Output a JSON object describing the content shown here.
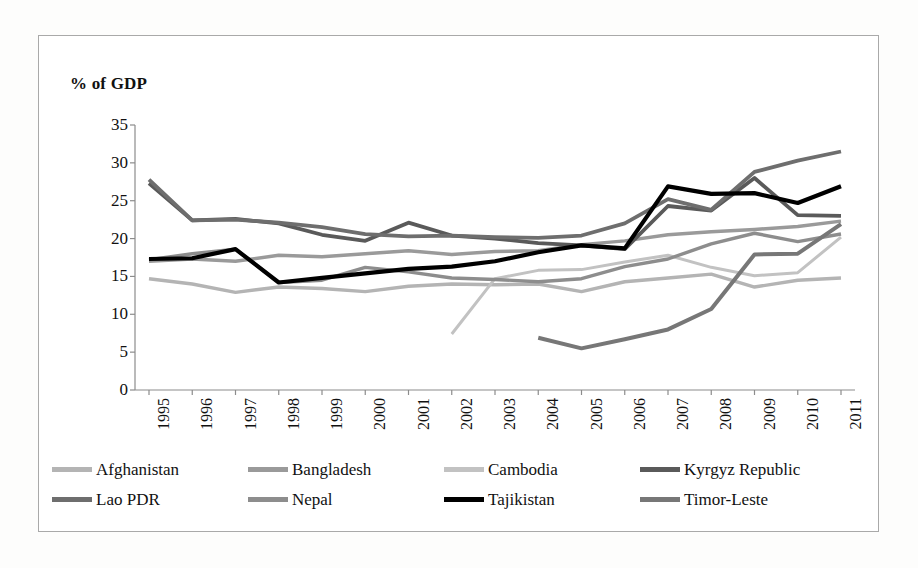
{
  "figure": {
    "axis_title": "% of GDP"
  },
  "chart_data": {
    "type": "line",
    "title": "% of GDP",
    "xlabel": "",
    "ylabel": "% of GDP",
    "ylim": [
      0,
      35
    ],
    "ytick_step": 5,
    "yticks": [
      "35",
      "30",
      "25",
      "20",
      "15",
      "10",
      "5",
      "0"
    ],
    "grid": false,
    "legend_position": "bottom",
    "x": [
      1995,
      1996,
      1997,
      1998,
      1999,
      2000,
      2001,
      2002,
      2003,
      2004,
      2005,
      2006,
      2007,
      2008,
      2009,
      2010,
      2011
    ],
    "categories": [
      "1995",
      "1996",
      "1997",
      "1998",
      "1999",
      "2000",
      "2001",
      "2002",
      "2003",
      "2004",
      "2005",
      "2006",
      "2007",
      "2008",
      "2009",
      "2010",
      "2011"
    ],
    "series": [
      {
        "name": "Afghanistan",
        "color": "#b4b4b4",
        "width": 3.4,
        "values": [
          14.7,
          14.0,
          12.9,
          13.6,
          13.4,
          13.0,
          13.7,
          14.0,
          13.9,
          14.0,
          13.0,
          14.3,
          14.8,
          15.3,
          13.6,
          14.5,
          14.8
        ]
      },
      {
        "name": "Bangladesh",
        "color": "#9a9a9a",
        "width": 3.4,
        "values": [
          17.0,
          17.3,
          17.0,
          17.8,
          17.6,
          18.0,
          18.4,
          17.9,
          18.3,
          18.4,
          19.2,
          19.7,
          20.5,
          20.9,
          21.2,
          21.6,
          22.3
        ]
      },
      {
        "name": "Cambodia",
        "color": "#c2c2c2",
        "width": 3.0,
        "values": [
          null,
          null,
          null,
          null,
          null,
          null,
          null,
          7.4,
          14.7,
          15.8,
          15.9,
          16.9,
          17.8,
          16.2,
          15.1,
          15.5,
          20.2
        ]
      },
      {
        "name": "Kyrgyz Republic",
        "color": "#5a5a5a",
        "width": 3.8,
        "values": [
          27.3,
          22.4,
          22.6,
          22.0,
          20.5,
          19.7,
          22.1,
          20.4,
          20.0,
          19.4,
          19.1,
          18.6,
          24.3,
          23.7,
          28.0,
          23.1,
          23.0
        ]
      },
      {
        "name": "Lao PDR",
        "color": "#6e6e6e",
        "width": 3.8,
        "values": [
          27.8,
          22.4,
          22.5,
          22.1,
          21.5,
          20.6,
          20.3,
          20.4,
          20.2,
          20.1,
          20.4,
          22.0,
          25.2,
          23.8,
          28.8,
          30.3,
          31.5
        ]
      },
      {
        "name": "Nepal",
        "color": "#8d8d8d",
        "width": 3.4,
        "values": [
          17.2,
          18.0,
          18.6,
          14.2,
          14.5,
          16.2,
          15.6,
          14.8,
          14.6,
          14.3,
          14.7,
          16.3,
          17.3,
          19.3,
          20.7,
          19.6,
          20.6
        ]
      },
      {
        "name": "Tajikistan",
        "color": "#000000",
        "width": 4.2,
        "values": [
          17.3,
          17.4,
          18.6,
          14.2,
          14.8,
          15.4,
          16.0,
          16.3,
          17.0,
          18.2,
          19.1,
          18.7,
          26.9,
          25.9,
          26.0,
          24.7,
          26.9
        ]
      },
      {
        "name": "Timor-Leste",
        "color": "#777777",
        "width": 4.0,
        "values": [
          null,
          null,
          null,
          null,
          null,
          null,
          null,
          null,
          null,
          6.9,
          5.5,
          6.7,
          8.0,
          10.7,
          17.9,
          18.0,
          21.9
        ]
      }
    ]
  },
  "legend": {
    "rows": [
      [
        {
          "label": "Afghanistan",
          "color": "#b4b4b4"
        },
        {
          "label": "Bangladesh",
          "color": "#9a9a9a"
        },
        {
          "label": "Cambodia",
          "color": "#c2c2c2"
        },
        {
          "label": "Kyrgyz Republic",
          "color": "#5a5a5a"
        }
      ],
      [
        {
          "label": "Lao PDR",
          "color": "#6e6e6e"
        },
        {
          "label": "Nepal",
          "color": "#8d8d8d"
        },
        {
          "label": "Tajikistan",
          "color": "#000000"
        },
        {
          "label": "Timor-Leste",
          "color": "#777777"
        }
      ]
    ]
  }
}
